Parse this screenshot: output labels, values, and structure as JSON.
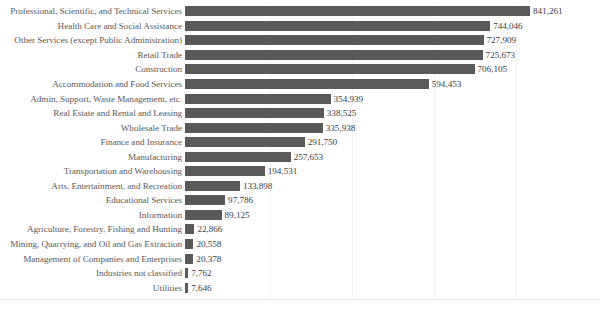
{
  "chart_data": {
    "type": "bar",
    "orientation": "horizontal",
    "title": "",
    "xlabel": "",
    "ylabel": "",
    "xlim": [
      0,
      900000
    ],
    "grid": true,
    "gridline_interval": 200000,
    "legend": "none",
    "bar_color": "#595959",
    "label_color": "#5a5a5a",
    "value_color": "#404040",
    "sorted": "descending",
    "categories": [
      "Professional, Scientific, and Technical Services",
      "Health Care and Social Assistance",
      "Other Services (except Public Administration)",
      "Retail Trade",
      "Construction",
      "Accommodation and Food Services",
      "Admin, Support, Waste Management, etc.",
      "Real Estate and Rental and Leasing",
      "Wholesale Trade",
      "Finance and Insurance",
      "Manufacturing",
      "Transportation and Warehousing",
      "Arts, Entertainment, and Recreation",
      "Educational Services",
      "Information",
      "Agriculture, Forestry, Fishing and Hunting",
      "Mining, Quarrying, and Oil and Gas Extraction",
      "Management of Companies and Enterprises",
      "Industries not classified",
      "Utilities"
    ],
    "values": [
      841261,
      744046,
      727909,
      725673,
      706105,
      594453,
      354939,
      338525,
      335938,
      291750,
      257653,
      194531,
      133898,
      97786,
      89125,
      22866,
      20558,
      20378,
      7762,
      7646
    ],
    "value_labels": [
      "841,261",
      "744,046",
      "727,909",
      "725,673",
      "706,105",
      "594,453",
      "354,939",
      "338,525",
      "335,938",
      "291,750",
      "257,653",
      "194,531",
      "133,898",
      "97,786",
      "89,125",
      "22,866",
      "20,558",
      "20,378",
      "7,762",
      "7,646"
    ]
  }
}
